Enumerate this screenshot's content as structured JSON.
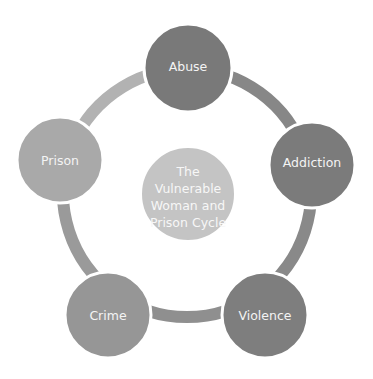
{
  "diagram": {
    "type": "cycle",
    "center": {
      "lines": [
        "The",
        "Vulnerable",
        "Woman and",
        "Prison Cycle"
      ],
      "color": "#c4c4c4"
    },
    "ring": {
      "segments": [
        {
          "from": "Abuse",
          "to": "Addiction",
          "color": "#878787"
        },
        {
          "from": "Addiction",
          "to": "Violence",
          "color": "#898989"
        },
        {
          "from": "Violence",
          "to": "Crime",
          "color": "#8f8f8f"
        },
        {
          "from": "Crime",
          "to": "Prison",
          "color": "#9a9a9a"
        },
        {
          "from": "Prison",
          "to": "Abuse",
          "color": "#b2b2b2"
        }
      ]
    },
    "nodes": [
      {
        "label": "Abuse",
        "color": "#797979"
      },
      {
        "label": "Addiction",
        "color": "#7b7b7b"
      },
      {
        "label": "Violence",
        "color": "#7e7e7e"
      },
      {
        "label": "Crime",
        "color": "#969696"
      },
      {
        "label": "Prison",
        "color": "#a9a9a9"
      }
    ]
  }
}
